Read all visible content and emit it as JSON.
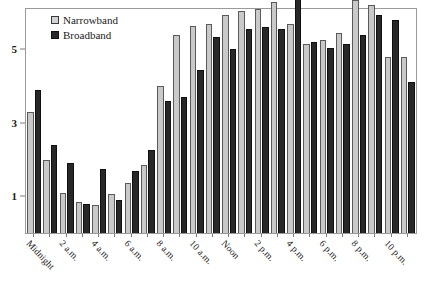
{
  "chart_data": {
    "type": "bar",
    "title": "",
    "subtitle": "",
    "xlabel": "",
    "ylabel": "",
    "grid": false,
    "legend_position": "top-left",
    "ylim": [
      0,
      6.1
    ],
    "yticks": [
      1,
      3,
      5
    ],
    "ytick_labels": [
      "1",
      "3",
      "5"
    ],
    "categories": [
      "Midnight",
      "1 a.m.",
      "2 a.m.",
      "3 a.m.",
      "4 a.m.",
      "5 a.m.",
      "6 a.m.",
      "7 a.m.",
      "8 a.m.",
      "9 a.m.",
      "10 a.m.",
      "11 a.m.",
      "Noon",
      "1 p.m.",
      "2 p.m.",
      "3 p.m.",
      "4 p.m.",
      "5 p.m.",
      "6 p.m.",
      "7 p.m.",
      "8 p.m.",
      "9 p.m.",
      "10 p.m.",
      "11 p.m."
    ],
    "xtick_labels": [
      "Midnight",
      "",
      "2 a.m.",
      "",
      "4 a.m.",
      "",
      "6 a.m.",
      "",
      "8 a.m.",
      "",
      "10 a.m.",
      "",
      "Noon",
      "",
      "2 p.m.",
      "",
      "4 p.m.",
      "",
      "6 p.m.",
      "",
      "8 p.m.",
      "",
      "10 p.m.",
      ""
    ],
    "series": [
      {
        "name": "Narrowband",
        "color": "#c9c9c9",
        "values": [
          3.3,
          2.0,
          1.1,
          0.85,
          0.75,
          1.05,
          1.35,
          1.85,
          4.0,
          5.4,
          5.65,
          5.7,
          5.95,
          6.05,
          6.1,
          6.3,
          5.7,
          5.15,
          5.25,
          5.45,
          6.35,
          6.2,
          4.8,
          4.8
        ],
        "pixel_tops": [
          121,
          164,
          199,
          207,
          210,
          200,
          191,
          175,
          104,
          60,
          55,
          54,
          45,
          42,
          40,
          35,
          54,
          70,
          66,
          60,
          30,
          35,
          78,
          78
        ]
      },
      {
        "name": "Broadband",
        "color": "#282828",
        "values": [
          3.9,
          2.4,
          1.9,
          0.8,
          1.75,
          0.9,
          1.7,
          2.25,
          3.6,
          3.7,
          4.45,
          5.35,
          5.0,
          5.55,
          5.6,
          5.55,
          6.55,
          5.2,
          5.05,
          5.15,
          5.4,
          5.95,
          5.8,
          4.1
        ]
      }
    ]
  },
  "legend": {
    "items": [
      {
        "label": "Narrowband",
        "swatch": "narrow"
      },
      {
        "label": "Broadband",
        "swatch": "broad"
      }
    ]
  }
}
